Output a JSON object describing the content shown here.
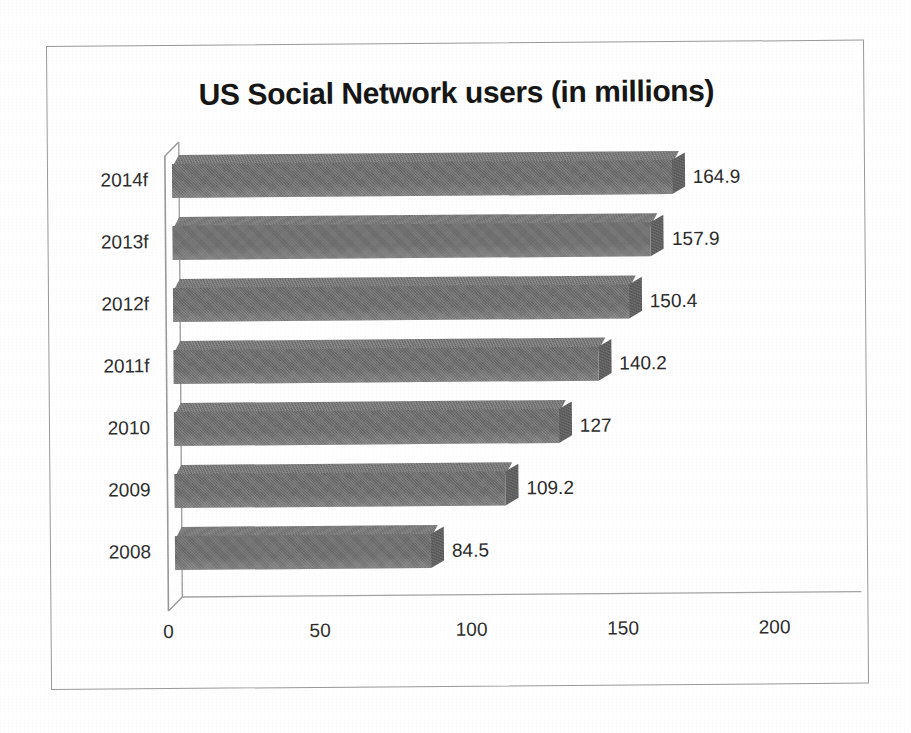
{
  "chart_data": {
    "type": "bar",
    "orientation": "horizontal",
    "title": "US Social Network users (in millions)",
    "xlabel": "",
    "ylabel": "",
    "categories": [
      "2014f",
      "2013f",
      "2012f",
      "2011f",
      "2010",
      "2009",
      "2008"
    ],
    "values": [
      164.9,
      157.9,
      150.4,
      140.2,
      127,
      109.2,
      84.5
    ],
    "value_labels": [
      "164.9",
      "157.9",
      "150.4",
      "140.2",
      "127",
      "109.2",
      "84.5"
    ],
    "series": [
      {
        "name": "US Social Network users (in millions)",
        "values": [
          164.9,
          157.9,
          150.4,
          140.2,
          127,
          109.2,
          84.5
        ]
      }
    ],
    "xlim": [
      0,
      200
    ],
    "xticks": [
      0,
      50,
      100,
      150,
      200
    ],
    "xtick_labels": [
      "0",
      "50",
      "100",
      "150",
      "200"
    ],
    "grid": false,
    "legend": false,
    "legend_position": "none",
    "style": "3d-bar",
    "bar_color": "#6d6d6d",
    "bar_top_color": "#757575",
    "bar_cap_color": "#5a5a5a",
    "title_color": "#161616",
    "axis_color": "#9a9a9a",
    "frame_color": "#9a9a9a",
    "background_color": "#ffffff",
    "data_label_color": "#2b2b2b"
  },
  "rows": [
    {
      "category": "2014f",
      "value": 164.9,
      "label": "164.9"
    },
    {
      "category": "2013f",
      "value": 157.9,
      "label": "157.9"
    },
    {
      "category": "2012f",
      "value": 150.4,
      "label": "150.4"
    },
    {
      "category": "2011f",
      "value": 140.2,
      "label": "140.2"
    },
    {
      "category": "2010",
      "value": 127,
      "label": "127"
    },
    {
      "category": "2009",
      "value": 109.2,
      "label": "109.2"
    },
    {
      "category": "2008",
      "value": 84.5,
      "label": "84.5"
    }
  ]
}
